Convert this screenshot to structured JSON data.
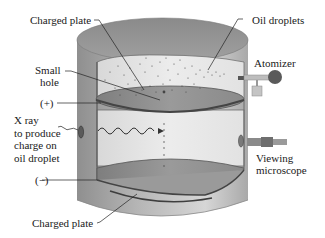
{
  "diagram": {
    "labels": {
      "top_plate": "Charged plate",
      "oil_droplets": "Oil droplets",
      "small_hole_line1": "Small",
      "small_hole_line2": "hole",
      "atomizer": "Atomizer",
      "positive": "(+)",
      "xray_line1": "X ray",
      "xray_line2": "to produce",
      "xray_line3": "charge on",
      "xray_line4": "oil droplet",
      "viewing_line1": "Viewing",
      "viewing_line2": "microscope",
      "negative": "(−)",
      "bottom_plate": "Charged plate"
    },
    "colors": {
      "cylinder_outer": "#9a9a9a",
      "cylinder_top": "#8c8c8c",
      "chamber_interior": "#e6e6e6",
      "plate": "#8a8a8a",
      "plate_edge": "#555555",
      "droplet": "#555555",
      "background": "#ffffff"
    }
  }
}
